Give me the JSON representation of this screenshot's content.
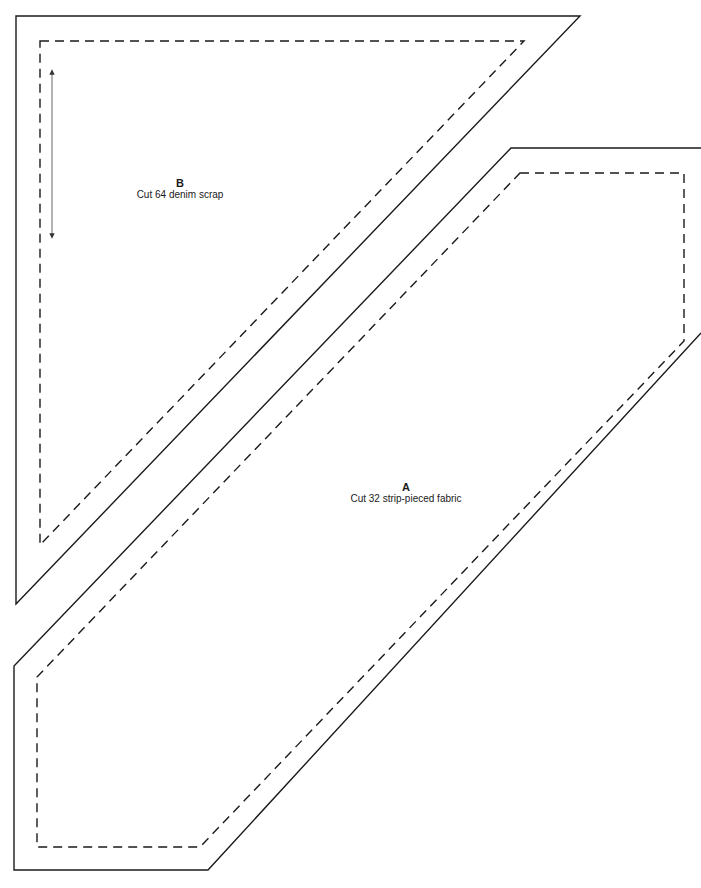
{
  "pieces": [
    {
      "id": "B",
      "letter": "B",
      "instruction": "Cut 64 denim scrap",
      "shape": "triangle",
      "has_grain_arrow": true
    },
    {
      "id": "A",
      "letter": "A",
      "instruction": "Cut 32 strip-pieced fabric",
      "shape": "elongated hexagon",
      "has_grain_arrow": false
    }
  ],
  "legend": {
    "solid_line": "cutting line",
    "dashed_line": "seam line"
  },
  "colors": {
    "line": "#1a1a1a",
    "background": "#ffffff"
  }
}
